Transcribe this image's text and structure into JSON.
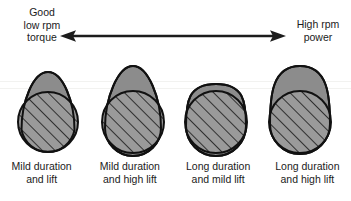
{
  "diagram": {
    "title_left": {
      "lines": [
        "Good",
        "low rpm",
        "torque"
      ]
    },
    "title_right": {
      "lines": [
        "High rpm",
        "power"
      ]
    },
    "arrow": {
      "name": "double-headed-arrow",
      "direction": "both",
      "color": "#1c1c1c"
    },
    "colors": {
      "nose_fill": "#8c8c8c",
      "base_fill": "#9a9a9a",
      "hatch_line": "#1e1e1e",
      "outline": "#111111",
      "text": "#1b1b1b",
      "background": "#ffffff"
    },
    "lobes": [
      {
        "id": "lobe-1",
        "caption": [
          "Mild duration",
          "and lift"
        ],
        "duration": "mild",
        "lift": "mild",
        "nose_shape": "narrow-pointed",
        "cx": 48,
        "base_radius": 30,
        "nose_top_y": 72
      },
      {
        "id": "lobe-2",
        "caption": [
          "Mild duration",
          "and high lift"
        ],
        "duration": "mild",
        "lift": "high",
        "nose_shape": "narrow-tall",
        "cx": 133,
        "base_radius": 31,
        "nose_top_y": 66
      },
      {
        "id": "lobe-3",
        "caption": [
          "Long duration",
          "and mild lift"
        ],
        "duration": "long",
        "lift": "mild",
        "nose_shape": "wide-blunt",
        "cx": 216,
        "base_radius": 31,
        "nose_top_y": 84
      },
      {
        "id": "lobe-4",
        "caption": [
          "Long duration",
          "and high lift"
        ],
        "duration": "long",
        "lift": "high",
        "nose_shape": "wide-tall-blunt",
        "cx": 300,
        "base_radius": 31,
        "nose_top_y": 66
      }
    ]
  }
}
